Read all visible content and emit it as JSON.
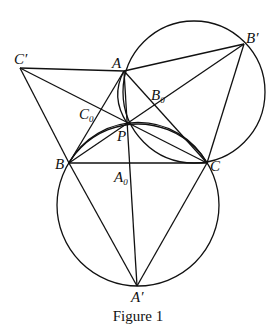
{
  "caption": "Figure 1",
  "points": {
    "A": {
      "label": "A",
      "sub": ""
    },
    "B": {
      "label": "B",
      "sub": ""
    },
    "C": {
      "label": "C",
      "sub": ""
    },
    "P": {
      "label": "P",
      "sub": ""
    },
    "A_prime": {
      "label": "A′",
      "sub": ""
    },
    "B_prime": {
      "label": "B′",
      "sub": ""
    },
    "C_prime": {
      "label": "C′",
      "sub": ""
    },
    "A0": {
      "label": "A",
      "sub": "0"
    },
    "B0": {
      "label": "B",
      "sub": "0"
    },
    "C0": {
      "label": "C",
      "sub": "0"
    }
  }
}
